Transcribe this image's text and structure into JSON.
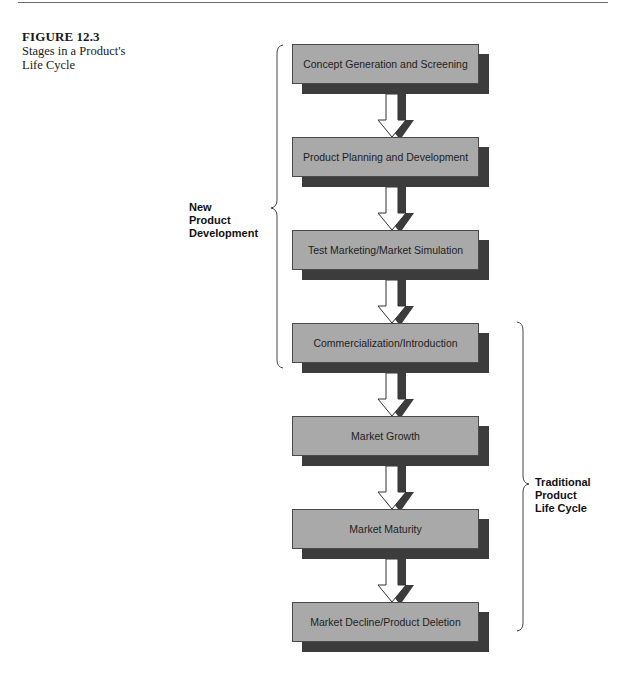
{
  "caption": {
    "figure_number": "FIGURE 12.3",
    "title_line1": "Stages in a Product's",
    "title_line2": "Life Cycle"
  },
  "stages": [
    {
      "label": "Concept Generation and Screening"
    },
    {
      "label": "Product Planning and Development"
    },
    {
      "label": "Test Marketing/Market Simulation"
    },
    {
      "label": "Commercialization/Introduction"
    },
    {
      "label": "Market Growth"
    },
    {
      "label": "Market Maturity"
    },
    {
      "label": "Market Decline/Product Deletion"
    }
  ],
  "groups": {
    "new_product_development": {
      "line1": "New",
      "line2": "Product",
      "line3": "Development",
      "spans_stages": [
        1,
        4
      ]
    },
    "traditional_life_cycle": {
      "line1": "Traditional",
      "line2": "Product",
      "line3": "Life Cycle",
      "spans_stages": [
        4,
        7
      ]
    }
  },
  "colors": {
    "box_fill": "#a9a9a9",
    "box_shadow": "#3c3c3c",
    "arrow_fill": "#ffffff",
    "arrow_shadow": "#3c3c3c"
  }
}
